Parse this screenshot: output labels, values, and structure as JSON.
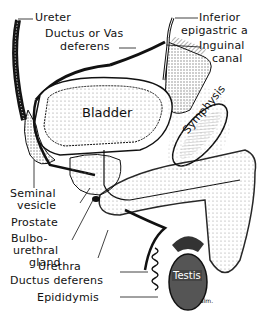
{
  "diagram": {
    "labels": {
      "ureter": "Ureter",
      "ductus_vas_line1": "Ductus or Vas",
      "ductus_vas_line2": "deferens",
      "inferior_epigastric_line1": "Inferior",
      "inferior_epigastric_line2": "epigastric a",
      "inguinal_line1": "Inguinal",
      "inguinal_line2": "canal",
      "bladder": "Bladder",
      "symphysis": "Symphysis",
      "seminal_line1": "Seminal",
      "seminal_line2": "vesicle",
      "prostate": "Prostate",
      "bulbo_line1": "Bulbo-",
      "bulbo_line2": "urethral",
      "bulbo_line3": "gland",
      "urethra": "Urethra",
      "ductus_deferens": "Ductus deferens",
      "epididymis": "Epididymis",
      "testis": "Testis",
      "signature": "alm."
    },
    "colors": {
      "ink": "#111111",
      "stipple": "#d9d9d9",
      "testis_fill": "#555555",
      "background": "#ffffff"
    }
  }
}
